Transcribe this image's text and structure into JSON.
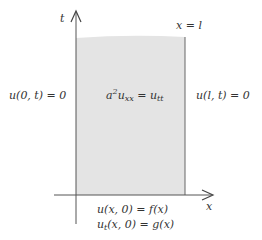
{
  "diagram": {
    "colors": {
      "region_fill": "#e4e4e4",
      "axis": "#555555",
      "text": "#333333"
    },
    "axes": {
      "vertical_label": "t",
      "horizontal_label": "x"
    },
    "boundary_right_label": "x = l",
    "left_condition": "u(0, t) = 0",
    "right_condition": "u(l, t) = 0",
    "equation": {
      "coef": "a",
      "coef_power": "2",
      "lhs_var": "u",
      "lhs_sub": "xx",
      "equals": " = ",
      "rhs_var": "u",
      "rhs_sub": "tt"
    },
    "initial_conditions": {
      "first": "u(x, 0) = f(x)",
      "second_var": "u",
      "second_sub": "t",
      "second_rest": "(x, 0) = g(x)"
    }
  }
}
